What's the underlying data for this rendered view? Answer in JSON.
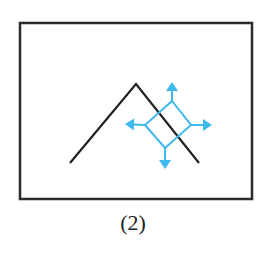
{
  "figure": {
    "caption": "(2)",
    "colors": {
      "frame": "#2b2b2b",
      "line": "#222222",
      "accent": "#3fb8ee"
    },
    "frame": {
      "x": 20,
      "y": 23,
      "width": 232,
      "height": 176
    },
    "zigzag_points": [
      [
        70,
        163
      ],
      [
        136,
        84
      ],
      [
        199,
        163
      ]
    ],
    "square_points": [
      [
        172,
        101
      ],
      [
        191,
        125
      ],
      [
        165,
        148
      ],
      [
        145,
        125
      ]
    ],
    "arrows": [
      {
        "direction": "up",
        "from": [
          172,
          101
        ],
        "to": [
          172,
          82
        ]
      },
      {
        "direction": "right",
        "from": [
          191,
          125
        ],
        "to": [
          212,
          125
        ]
      },
      {
        "direction": "down",
        "from": [
          165,
          148
        ],
        "to": [
          165,
          169
        ]
      },
      {
        "direction": "left",
        "from": [
          145,
          125
        ],
        "to": [
          125,
          124
        ]
      }
    ]
  }
}
